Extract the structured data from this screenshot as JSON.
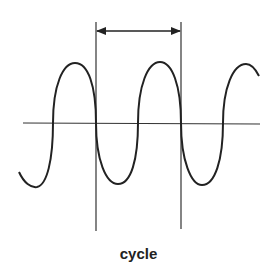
{
  "diagram": {
    "title": "cycle",
    "label": "cycle",
    "elements": {
      "wave": "sine-wave",
      "axis": "horizontal-axis",
      "markers": [
        "left-cycle-marker",
        "right-cycle-marker"
      ],
      "dimension": "double-headed-arrow"
    },
    "colors": {
      "stroke": "#222222",
      "background": "#ffffff"
    }
  }
}
